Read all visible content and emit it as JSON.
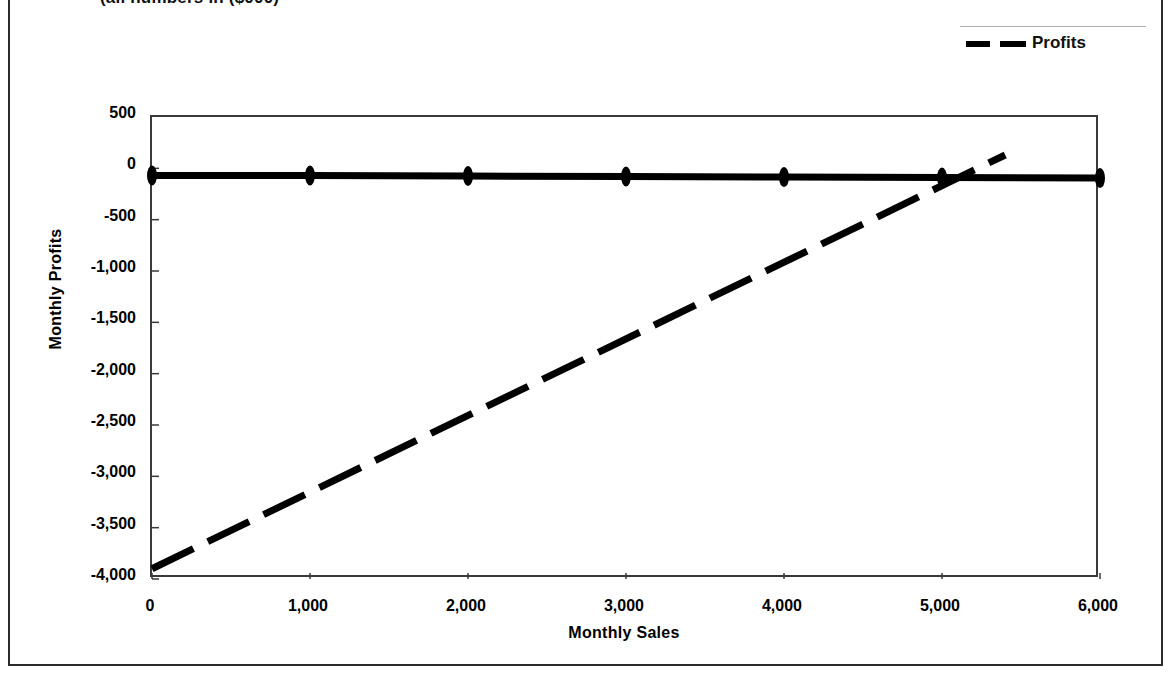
{
  "chart_data": {
    "type": "line",
    "title": "(all numbers in ($000)",
    "xlabel": "Monthly Sales",
    "ylabel": "Monthly Profits",
    "xlim": [
      0,
      6000
    ],
    "ylim": [
      -4000,
      500
    ],
    "grid": false,
    "legend_position": "top-right",
    "xticks": [
      "0",
      "1,000",
      "2,000",
      "3,000",
      "4,000",
      "5,000",
      "6,000"
    ],
    "xtick_values": [
      0,
      1000,
      2000,
      3000,
      4000,
      5000,
      6000
    ],
    "yticks": [
      "500",
      "0",
      "-500",
      "-1,000",
      "-1,500",
      "-2,000",
      "-2,500",
      "-3,000",
      "-3,500",
      "-4,000"
    ],
    "ytick_values": [
      500,
      0,
      -500,
      -1000,
      -1500,
      -2000,
      -2500,
      -3000,
      -3500,
      -4000
    ],
    "series": [
      {
        "name": "baseline",
        "style": "solid",
        "width": 7,
        "color": "#000000",
        "markers": true,
        "marker_shape": "ellipse",
        "x": [
          0,
          1000,
          2000,
          3000,
          4000,
          5000,
          6000
        ],
        "values": [
          -70,
          -70,
          -75,
          -80,
          -85,
          -90,
          -95
        ]
      },
      {
        "name": "Profits",
        "style": "dashed",
        "width": 7,
        "color": "#000000",
        "markers": false,
        "x": [
          0,
          5400
        ],
        "values": [
          -3900,
          130
        ]
      }
    ],
    "legend": [
      {
        "label": "Profits",
        "style": "dashed",
        "color": "#000000"
      }
    ]
  }
}
